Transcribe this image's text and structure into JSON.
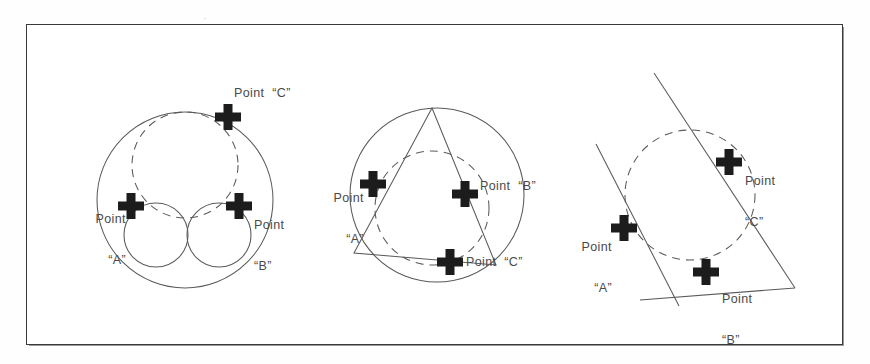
{
  "sheet": {
    "title": "Three-point circle construction reference",
    "background_color": "#ffffff",
    "frame_color": "#3a3a3a",
    "ink_color": "#555555",
    "marker_color": "#1a1a1a",
    "label_color": "#4a4a4a"
  },
  "figures": [
    {
      "id": "figure-1",
      "name": "tangent-circles-construction",
      "labels": [
        {
          "key": "c",
          "line1": "Point",
          "line2": "“C”",
          "single": "Point  “C”"
        },
        {
          "key": "a",
          "line1": "Point",
          "line2": "“A”"
        },
        {
          "key": "b",
          "line1": "Point",
          "line2": "“B”"
        }
      ],
      "markers": [
        {
          "key": "a",
          "label": "Point “A”"
        },
        {
          "key": "b",
          "label": "Point “B”"
        },
        {
          "key": "c",
          "label": "Point “C”"
        }
      ]
    },
    {
      "id": "figure-2",
      "name": "inscribed-triangle-construction",
      "labels": [
        {
          "key": "a",
          "line1": "Point",
          "line2": "“A”"
        },
        {
          "key": "b",
          "single": "Point  “B”"
        },
        {
          "key": "c",
          "single": "Point  “C”"
        }
      ],
      "markers": [
        {
          "key": "a",
          "label": "Point “A”"
        },
        {
          "key": "b",
          "label": "Point “B”"
        },
        {
          "key": "c",
          "label": "Point “C”"
        }
      ]
    },
    {
      "id": "figure-3",
      "name": "tangent-lines-construction",
      "labels": [
        {
          "key": "c",
          "line1": "Point",
          "line2": "“C”"
        },
        {
          "key": "a",
          "line1": "Point",
          "line2": "“A”"
        },
        {
          "key": "b",
          "line1": "Point",
          "line2": "“B”"
        }
      ],
      "markers": [
        {
          "key": "a",
          "label": "Point “A”"
        },
        {
          "key": "b",
          "label": "Point “B”"
        },
        {
          "key": "c",
          "label": "Point “C”"
        }
      ]
    }
  ],
  "artifacts": {
    "top_speck": "·"
  }
}
